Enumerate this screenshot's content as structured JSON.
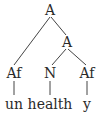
{
  "diagram": {
    "type": "syntax-tree",
    "line_color": "#444444",
    "text_color": "#2a2a2a",
    "nodes": [
      {
        "id": "root",
        "label": "A",
        "x": 50,
        "y": 10
      },
      {
        "id": "a2",
        "label": "A",
        "x": 67,
        "y": 42
      },
      {
        "id": "af1",
        "label": "Af",
        "x": 14,
        "y": 73
      },
      {
        "id": "n",
        "label": "N",
        "x": 50,
        "y": 73
      },
      {
        "id": "af2",
        "label": "Af",
        "x": 87,
        "y": 73
      },
      {
        "id": "leaf-un",
        "label": "un",
        "x": 14,
        "y": 104
      },
      {
        "id": "leaf-health",
        "label": "health",
        "x": 50,
        "y": 104
      },
      {
        "id": "leaf-y",
        "label": "y",
        "x": 87,
        "y": 104
      }
    ],
    "edges": [
      {
        "from": "root",
        "to": "af1"
      },
      {
        "from": "root",
        "to": "a2"
      },
      {
        "from": "a2",
        "to": "n"
      },
      {
        "from": "a2",
        "to": "af2"
      },
      {
        "from": "af1",
        "to": "leaf-un"
      },
      {
        "from": "n",
        "to": "leaf-health"
      },
      {
        "from": "af2",
        "to": "leaf-y"
      }
    ]
  }
}
